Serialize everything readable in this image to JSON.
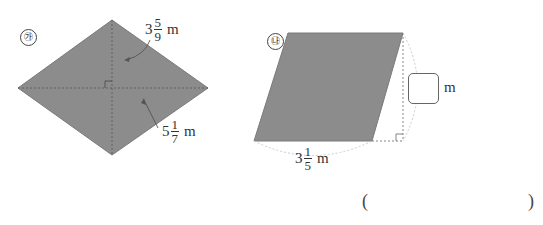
{
  "figure_a": {
    "marker": "㉮",
    "shape": "rhombus",
    "diagonal_1": {
      "whole": "3",
      "numerator": "5",
      "denominator": "9",
      "unit": "m"
    },
    "diagonal_2": {
      "whole": "5",
      "numerator": "1",
      "denominator": "7",
      "unit": "m"
    },
    "fill_color": "#8c8c8c"
  },
  "figure_b": {
    "marker": "㉯",
    "shape": "parallelogram",
    "base": {
      "whole": "3",
      "numerator": "1",
      "denominator": "5",
      "unit": "m"
    },
    "height_unit": "m",
    "fill_color": "#8c8c8c"
  },
  "answer": {
    "open_paren": "(",
    "close_paren": ")",
    "value": ""
  }
}
